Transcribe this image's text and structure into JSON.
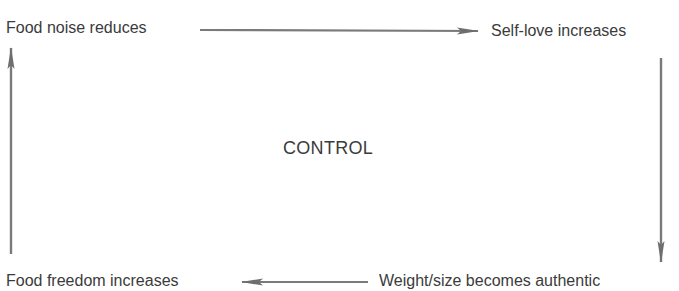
{
  "diagram": {
    "type": "cycle",
    "center_label": "CONTROL",
    "nodes": {
      "top_left": "Food noise reduces",
      "top_right": "Self-love increases",
      "bottom_right": "Weight/size becomes authentic",
      "bottom_left": "Food freedom increases"
    },
    "edges": [
      {
        "from": "Food noise reduces",
        "to": "Self-love increases",
        "direction": "right"
      },
      {
        "from": "Self-love increases",
        "to": "Weight/size becomes authentic",
        "direction": "down"
      },
      {
        "from": "Weight/size becomes authentic",
        "to": "Food freedom increases",
        "direction": "left"
      },
      {
        "from": "Food freedom increases",
        "to": "Food noise reduces",
        "direction": "up"
      }
    ],
    "colors": {
      "arrow": "#6e6e6e",
      "text": "#3b3b3b",
      "background": "#ffffff"
    }
  }
}
